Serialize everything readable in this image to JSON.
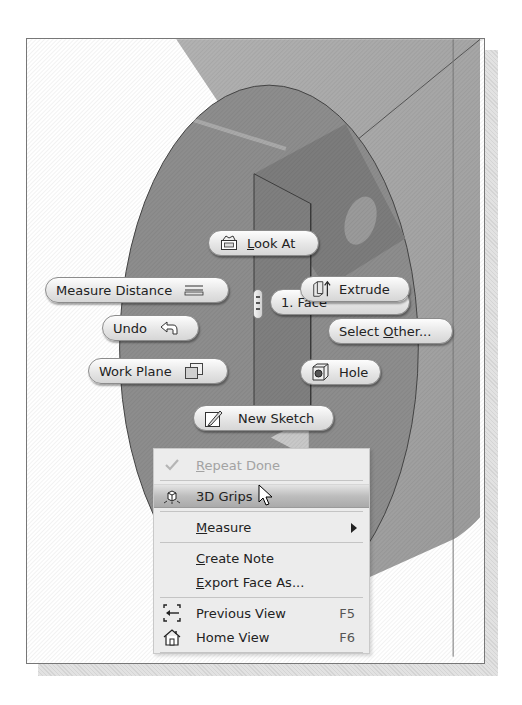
{
  "scene": {
    "description": "3D CAD viewport showing a cylindrical part with a rectangular cut and hole",
    "colors": {
      "disc_face": "#8e8e8e",
      "cylinder_body": "#a8a8a8",
      "background_top": "#d9d9d9",
      "pill_bg": "#ececec",
      "menu_bg": "#ececec",
      "menu_highlight": "#b4b4b4"
    }
  },
  "marking_menu": {
    "look_at": {
      "label_pre": "",
      "mnemonic": "L",
      "label_post": "ook At",
      "icon": "look-at-icon"
    },
    "measure_distance": {
      "label": "Measure Distance",
      "icon": "measure-distance-icon"
    },
    "extrude": {
      "label": "Extrude",
      "icon": "extrude-icon"
    },
    "face_selector": {
      "label": "1. Face"
    },
    "undo": {
      "label": "Undo",
      "icon": "undo-arrow-icon"
    },
    "select_other": {
      "label_pre": "Select ",
      "mnemonic": "O",
      "label_post": "ther...",
      "icon": ""
    },
    "work_plane": {
      "label": "Work Plane",
      "icon": "work-plane-icon"
    },
    "hole": {
      "label": "Hole",
      "icon": "hole-icon"
    },
    "new_sketch": {
      "label": "New Sketch",
      "icon": "new-sketch-icon"
    }
  },
  "context_menu": {
    "items": [
      {
        "mnemonic": "R",
        "rest": "epeat Done",
        "icon": "checkmark-icon",
        "disabled": true
      },
      {
        "mnemonic": "",
        "rest": "3D Grips",
        "icon": "3d-grips-icon",
        "highlighted": true
      },
      {
        "mnemonic": "M",
        "rest": "easure",
        "submenu": true
      },
      {
        "mnemonic": "C",
        "rest": "reate Note"
      },
      {
        "mnemonic": "E",
        "rest": "xport Face As..."
      },
      {
        "mnemonic": "",
        "rest": "Previous View",
        "shortcut": "F5",
        "icon": "previous-view-icon"
      },
      {
        "mnemonic": "",
        "rest": "Home View",
        "shortcut": "F6",
        "icon": "home-view-icon"
      }
    ]
  }
}
